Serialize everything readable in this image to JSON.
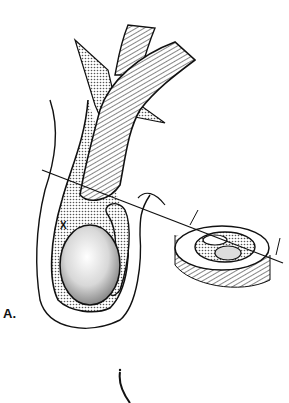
{
  "figure": {
    "panel_label": "A.",
    "marker_label": "X",
    "colors": {
      "ink": "#111111",
      "stipple": "#888888",
      "background": "#ffffff"
    }
  }
}
